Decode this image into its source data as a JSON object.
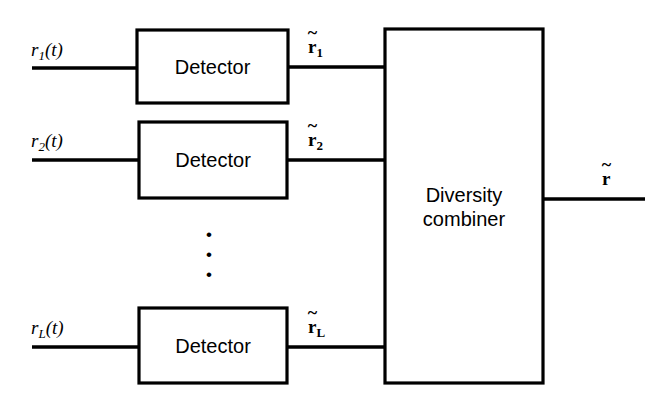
{
  "figure": {
    "type": "block-diagram",
    "background_color": "#ffffff",
    "line_color": "#000000"
  },
  "branches": [
    {
      "input_label": {
        "base": "r",
        "subscript": "1",
        "arg": "(t)",
        "text": "r1(t)"
      },
      "block_label": "Detector",
      "output_label": {
        "base": "r",
        "tilde": "~",
        "subscript": "1",
        "text": "r~1"
      }
    },
    {
      "input_label": {
        "base": "r",
        "subscript": "2",
        "arg": "(t)",
        "text": "r2(t)"
      },
      "block_label": "Detector",
      "output_label": {
        "base": "r",
        "tilde": "~",
        "subscript": "2",
        "text": "r~2"
      }
    },
    {
      "input_label": {
        "base": "r",
        "subscript": "L",
        "arg": "(t)",
        "text": "rL(t)"
      },
      "block_label": "Detector",
      "output_label": {
        "base": "r",
        "tilde": "~",
        "subscript": "L",
        "text": "r~L"
      }
    }
  ],
  "ellipsis": {
    "glyph": "•",
    "count": 3,
    "orientation": "vertical"
  },
  "combiner": {
    "label_line1": "Diversity",
    "label_line2": "combiner"
  },
  "output": {
    "label": {
      "base": "r",
      "tilde": "~",
      "text": "r~"
    }
  }
}
